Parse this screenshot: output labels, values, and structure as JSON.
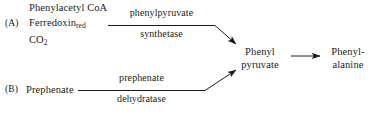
{
  "diagram": {
    "type": "biochemical-pathway",
    "background_color": "#ffffff",
    "line_color": "#1a1a1a",
    "branches": [
      {
        "id": "A",
        "letter": "(A)",
        "substrates": [
          "Phenylacetyl CoA",
          "Ferredoxin",
          "CO"
        ],
        "substrate_subscripts": [
          "",
          "red",
          "2"
        ],
        "enzyme_top": "phenylpyruvate",
        "enzyme_bottom": "synthetase"
      },
      {
        "id": "B",
        "letter": "(B)",
        "substrates": [
          "Prephenate"
        ],
        "substrate_subscripts": [
          ""
        ],
        "enzyme_top": "prephenate",
        "enzyme_bottom": "dehydratase"
      }
    ],
    "nodes": [
      {
        "id": "phenylpyruvate",
        "line1": "Phenyl",
        "line2": "pyruvate"
      },
      {
        "id": "phenylalanine",
        "line1": "Phenyl-",
        "line2": "alanine"
      }
    ]
  }
}
